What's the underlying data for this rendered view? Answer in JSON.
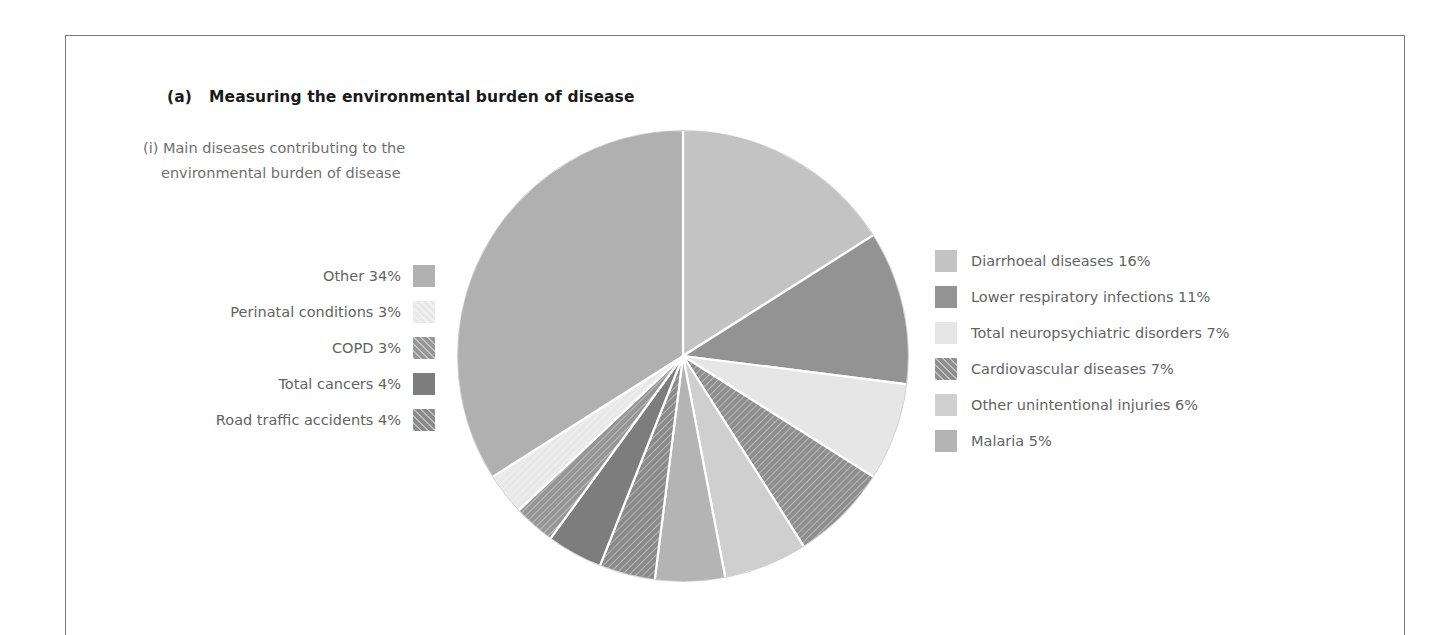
{
  "panel": {
    "tag": "(a)",
    "title": "Measuring the environmental burden of disease",
    "subtitle_line1": "(i) Main diseases contributing to the",
    "subtitle_line2": "environmental burden of disease"
  },
  "colors": {
    "text_title": "#1a1a1a",
    "text_body": "#636363",
    "frame": "#7a7a7a",
    "background": "#ffffff",
    "slice_separator": "#ffffff"
  },
  "legend_left": [
    {
      "label": "Other 34%",
      "swatch_color": "#b0b0b0",
      "hatched": false,
      "name": "other"
    },
    {
      "label": "Perinatal conditions 3%",
      "swatch_color": "#e8e8e8",
      "hatched": true,
      "name": "perinatal-conditions"
    },
    {
      "label": "COPD 3%",
      "swatch_color": "#969696",
      "hatched": true,
      "name": "copd"
    },
    {
      "label": "Total cancers 4%",
      "swatch_color": "#7d7d7d",
      "hatched": false,
      "name": "total-cancers"
    },
    {
      "label": "Road traffic accidents 4%",
      "swatch_color": "#8a8a8a",
      "hatched": true,
      "name": "road-traffic-accidents"
    }
  ],
  "legend_right": [
    {
      "label": "Diarrhoeal diseases 16%",
      "swatch_color": "#c3c3c3",
      "hatched": false,
      "name": "diarrhoeal-diseases"
    },
    {
      "label": "Lower respiratory infections 11%",
      "swatch_color": "#939393",
      "hatched": false,
      "name": "lower-respiratory-infections"
    },
    {
      "label": "Total neuropsychiatric disorders 7%",
      "swatch_color": "#e6e6e6",
      "hatched": false,
      "name": "total-neuropsychiatric-disorders"
    },
    {
      "label": "Cardiovascular diseases 7%",
      "swatch_color": "#8e8e8e",
      "hatched": true,
      "name": "cardiovascular-diseases"
    },
    {
      "label": "Other unintentional injuries 6%",
      "swatch_color": "#cfcfcf",
      "hatched": false,
      "name": "other-unintentional-injuries"
    },
    {
      "label": "Malaria 5%",
      "swatch_color": "#b4b4b4",
      "hatched": false,
      "name": "malaria"
    }
  ],
  "chart_data": {
    "type": "pie",
    "title": "Main diseases contributing to the environmental burden of disease",
    "unit": "percent",
    "start_angle_deg": 0,
    "direction": "clockwise",
    "center": {
      "x": 683,
      "y": 356
    },
    "radius": 226,
    "legend_position": "both-sides",
    "grid": false,
    "categories": [
      "Diarrhoeal diseases",
      "Lower respiratory infections",
      "Total neuropsychiatric disorders",
      "Cardiovascular diseases",
      "Other unintentional injuries",
      "Malaria",
      "Road traffic accidents",
      "Total cancers",
      "COPD",
      "Perinatal conditions",
      "Other"
    ],
    "values": [
      16,
      11,
      7,
      7,
      6,
      5,
      4,
      4,
      3,
      3,
      34
    ],
    "slices": [
      {
        "label": "Diarrhoeal diseases",
        "value": 16,
        "color": "#c3c3c3",
        "hatched": false
      },
      {
        "label": "Lower respiratory infections",
        "value": 11,
        "color": "#939393",
        "hatched": false
      },
      {
        "label": "Total neuropsychiatric disorders",
        "value": 7,
        "color": "#e6e6e6",
        "hatched": false
      },
      {
        "label": "Cardiovascular diseases",
        "value": 7,
        "color": "#8e8e8e",
        "hatched": true
      },
      {
        "label": "Other unintentional injuries",
        "value": 6,
        "color": "#cfcfcf",
        "hatched": false
      },
      {
        "label": "Malaria",
        "value": 5,
        "color": "#b4b4b4",
        "hatched": false
      },
      {
        "label": "Road traffic accidents",
        "value": 4,
        "color": "#8a8a8a",
        "hatched": true
      },
      {
        "label": "Total cancers",
        "value": 4,
        "color": "#7d7d7d",
        "hatched": false
      },
      {
        "label": "COPD",
        "value": 3,
        "color": "#969696",
        "hatched": true
      },
      {
        "label": "Perinatal conditions",
        "value": 3,
        "color": "#e8e8e8",
        "hatched": true
      },
      {
        "label": "Other",
        "value": 34,
        "color": "#b0b0b0",
        "hatched": false
      }
    ]
  }
}
